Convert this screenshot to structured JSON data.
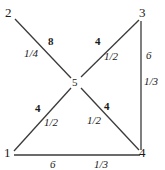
{
  "diagram": {
    "type": "weighted-graph",
    "width": 165,
    "height": 170,
    "background_color": "#ffffff",
    "line_color": "#3a3a3a",
    "text_color": "#1a1a1a",
    "nodes": [
      {
        "id": "2",
        "label": "2",
        "x": 9,
        "y": 12
      },
      {
        "id": "3",
        "label": "3",
        "x": 143,
        "y": 12
      },
      {
        "id": "5",
        "label": "5",
        "x": 76,
        "y": 83
      },
      {
        "id": "1",
        "label": "1",
        "x": 8,
        "y": 152
      },
      {
        "id": "4",
        "label": "4",
        "x": 143,
        "y": 152
      }
    ],
    "edges": [
      {
        "id": "e-2-5",
        "from": "2",
        "to": "5",
        "weight": "8",
        "fraction": "1/4",
        "weight_x": 48,
        "weight_y": 36,
        "fraction_x": 24,
        "fraction_y": 48
      },
      {
        "id": "e-5-3",
        "from": "5",
        "to": "3",
        "weight": "4",
        "fraction": "1/2",
        "weight_x": 95,
        "weight_y": 36,
        "fraction_x": 104,
        "fraction_y": 51
      },
      {
        "id": "e-3-4",
        "from": "3",
        "to": "4",
        "weight": "6",
        "fraction": "1/3",
        "weight_x": 146,
        "weight_y": 50,
        "fraction_x": 144,
        "fraction_y": 76
      },
      {
        "id": "e-1-5",
        "from": "1",
        "to": "5",
        "weight": "4",
        "fraction": "1/2",
        "weight_x": 35,
        "weight_y": 103,
        "fraction_x": 44,
        "fraction_y": 117
      },
      {
        "id": "e-5-4",
        "from": "5",
        "to": "4",
        "weight": "4",
        "fraction": "1/2",
        "weight_x": 104,
        "weight_y": 101,
        "fraction_x": 87,
        "fraction_y": 115
      },
      {
        "id": "e-1-4",
        "from": "1",
        "to": "4",
        "weight": "6",
        "fraction": "1/3",
        "weight_x": 50,
        "weight_y": 159,
        "fraction_x": 94,
        "fraction_y": 159
      }
    ]
  }
}
